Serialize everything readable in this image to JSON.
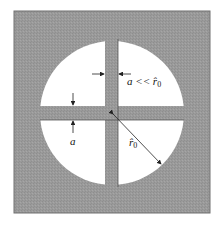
{
  "figure": {
    "colors": {
      "plate": "#9a9a9a",
      "plate_border": "#707070",
      "aperture": "#ffffff",
      "bar": "#a3a3a3",
      "line": "#222222"
    }
  },
  "labels": {
    "vertical_bar_width": "a << r̂",
    "vertical_bar_width_sub": "0",
    "horizontal_bar_width": "a",
    "radius": "r̂",
    "radius_sub": "0"
  }
}
